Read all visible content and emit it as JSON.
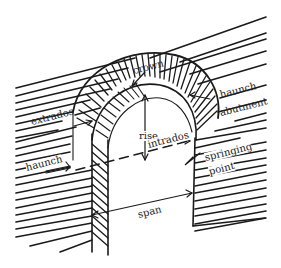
{
  "diagram": {
    "labels": {
      "crown": "crown",
      "extrados": "extrados",
      "haunch_right": "haunch",
      "abutment": "abutment",
      "rise": "rise",
      "intrados": "intrados",
      "haunch_left": "haunch",
      "springing_point_line1": "springing",
      "springing_point_line2": "point",
      "span": "span"
    },
    "colors": {
      "ink": "#1a1a1a",
      "background": "#ffffff"
    }
  }
}
